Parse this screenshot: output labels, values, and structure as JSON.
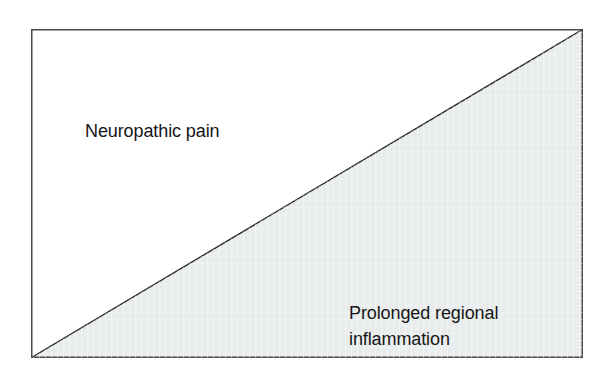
{
  "figure": {
    "type": "schematic-diagram",
    "background_color": "#ffffff"
  },
  "frame": {
    "border_color": "#4a4a4a",
    "fill_color": "#ffffff"
  },
  "divider": {
    "name": "diagonal-divider",
    "color": "#2e2e2e",
    "from": "bottom-left",
    "to": "top-right"
  },
  "regions": [
    {
      "id": "upper-left",
      "label": "Neuropathic pain",
      "fill_color": "#ffffff",
      "text_color": "#161616"
    },
    {
      "id": "lower-right",
      "label": "Prolonged regional\ninflammation",
      "fill_color": "#e9ecec",
      "text_color": "#161616"
    }
  ]
}
